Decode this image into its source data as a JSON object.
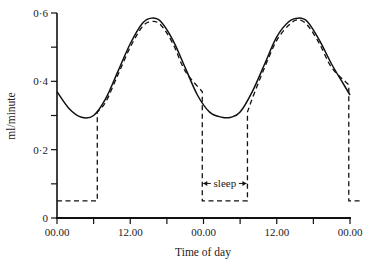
{
  "chart_data": {
    "type": "line",
    "title": "",
    "xlabel": "Time of day",
    "ylabel": "ml/minute",
    "ylim": [
      0,
      0.6
    ],
    "xlim_hours": [
      0,
      48
    ],
    "y_ticks": [
      {
        "value": 0,
        "label": "0"
      },
      {
        "value": 0.1,
        "label": ""
      },
      {
        "value": 0.2,
        "label": "0·2"
      },
      {
        "value": 0.3,
        "label": ""
      },
      {
        "value": 0.4,
        "label": "0·4"
      },
      {
        "value": 0.5,
        "label": ""
      },
      {
        "value": 0.6,
        "label": "0·6"
      }
    ],
    "x_ticks": [
      {
        "hour": 0,
        "label": "00.00"
      },
      {
        "hour": 6,
        "label": ""
      },
      {
        "hour": 12,
        "label": "12.00"
      },
      {
        "hour": 18,
        "label": ""
      },
      {
        "hour": 24,
        "label": "00.00"
      },
      {
        "hour": 30,
        "label": ""
      },
      {
        "hour": 36,
        "label": "12.00"
      },
      {
        "hour": 42,
        "label": ""
      },
      {
        "hour": 48,
        "label": "00.00"
      }
    ],
    "grid": false,
    "legend": null,
    "annotations": [
      {
        "text": "sleep",
        "from_hour": 23.8,
        "to_hour": 31.2,
        "y": 0.11
      }
    ],
    "series": [
      {
        "name": "circadian rhythm (solid)",
        "style": "solid",
        "x": [
          0,
          2,
          4,
          6,
          8,
          10,
          12,
          14,
          15.5,
          17,
          19,
          21,
          23,
          25,
          27,
          28.5,
          30,
          32,
          34,
          36,
          38,
          39.5,
          41,
          43,
          45,
          47,
          48
        ],
        "values": [
          0.37,
          0.32,
          0.295,
          0.3,
          0.35,
          0.43,
          0.51,
          0.57,
          0.585,
          0.575,
          0.52,
          0.44,
          0.36,
          0.31,
          0.295,
          0.295,
          0.31,
          0.37,
          0.45,
          0.53,
          0.575,
          0.585,
          0.575,
          0.52,
          0.45,
          0.39,
          0.36
        ]
      },
      {
        "name": "measured with sleep (dashed)",
        "style": "dashed",
        "x": [
          0,
          6.6,
          6.6,
          8,
          10,
          12,
          14,
          15.5,
          17,
          19,
          21,
          23.8,
          23.8,
          31.2,
          31.2,
          32,
          34,
          36,
          38,
          39.5,
          41,
          43,
          45,
          47.8,
          47.8,
          50
        ],
        "values": [
          0.05,
          0.05,
          0.31,
          0.34,
          0.42,
          0.5,
          0.56,
          0.575,
          0.565,
          0.51,
          0.43,
          0.37,
          0.05,
          0.05,
          0.31,
          0.35,
          0.44,
          0.52,
          0.565,
          0.58,
          0.565,
          0.51,
          0.44,
          0.39,
          0.05,
          0.05
        ]
      }
    ]
  }
}
